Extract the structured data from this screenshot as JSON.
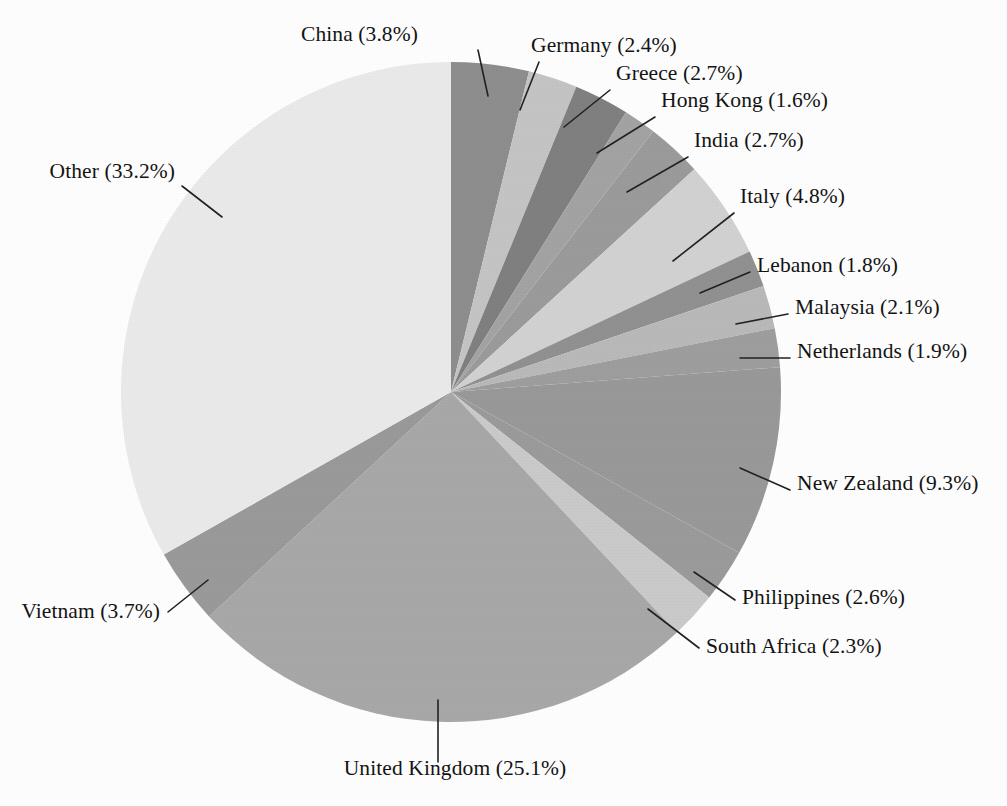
{
  "page": {
    "title_partial": "",
    "background_color": "#fefefe"
  },
  "chart_data": {
    "type": "pie",
    "title": "",
    "subtitle": "",
    "xlabel": "",
    "ylabel": "",
    "legend_position": "none",
    "grid": false,
    "label_format": "{name} ({value}%)",
    "start_angle_deg": 0,
    "direction": "clockwise",
    "center": {
      "x": 451,
      "y": 392
    },
    "radius": 330,
    "categories": [
      "China",
      "Germany",
      "Greece",
      "Hong Kong",
      "India",
      "Italy",
      "Lebanon",
      "Malaysia",
      "Netherlands",
      "New Zealand",
      "Philippines",
      "South Africa",
      "United Kingdom",
      "Vietnam",
      "Other"
    ],
    "values": [
      3.8,
      2.4,
      2.7,
      1.6,
      2.7,
      4.8,
      1.8,
      2.1,
      1.9,
      9.3,
      2.6,
      2.3,
      25.1,
      3.7,
      33.2
    ],
    "unit": "%",
    "slices": [
      {
        "name": "China",
        "value": 3.8,
        "label": "China (3.8%)",
        "color": "#8e8e8e",
        "label_x": 418,
        "label_y": 41,
        "anchor": "end",
        "leader": [
          [
            478,
            50
          ],
          [
            488,
            96
          ]
        ]
      },
      {
        "name": "Germany",
        "value": 2.4,
        "label": "Germany (2.4%)",
        "color": "#c4c4c4",
        "label_x": 531,
        "label_y": 52,
        "anchor": "start",
        "leader": [
          [
            539,
            62
          ],
          [
            520,
            110
          ]
        ]
      },
      {
        "name": "Greece",
        "value": 2.7,
        "label": "Greece (2.7%)",
        "color": "#808080",
        "label_x": 616,
        "label_y": 80,
        "anchor": "start",
        "leader": [
          [
            610,
            90
          ],
          [
            564,
            127
          ]
        ]
      },
      {
        "name": "Hong Kong",
        "value": 1.6,
        "label": "Hong Kong (1.6%)",
        "color": "#a3a3a3",
        "label_x": 661,
        "label_y": 107,
        "anchor": "start",
        "leader": [
          [
            655,
            117
          ],
          [
            597,
            153
          ]
        ]
      },
      {
        "name": "India",
        "value": 2.7,
        "label": "India (2.7%)",
        "color": "#9b9b9b",
        "label_x": 694,
        "label_y": 147,
        "anchor": "start",
        "leader": [
          [
            688,
            157
          ],
          [
            627,
            192
          ]
        ]
      },
      {
        "name": "Italy",
        "value": 4.8,
        "label": "Italy (4.8%)",
        "color": "#d2d2d2",
        "label_x": 740,
        "label_y": 203,
        "anchor": "start",
        "leader": [
          [
            734,
            213
          ],
          [
            673,
            261
          ]
        ]
      },
      {
        "name": "Lebanon",
        "value": 1.8,
        "label": "Lebanon (1.8%)",
        "color": "#919191",
        "label_x": 757,
        "label_y": 272,
        "anchor": "start",
        "leader": [
          [
            750,
            272
          ],
          [
            700,
            293
          ]
        ]
      },
      {
        "name": "Malaysia",
        "value": 2.1,
        "label": "Malaysia (2.1%)",
        "color": "#b9b9b9",
        "label_x": 795,
        "label_y": 314,
        "anchor": "start",
        "leader": [
          [
            788,
            314
          ],
          [
            736,
            324
          ]
        ]
      },
      {
        "name": "Netherlands",
        "value": 1.9,
        "label": "Netherlands (1.9%)",
        "color": "#9e9e9e",
        "label_x": 797,
        "label_y": 358,
        "anchor": "start",
        "leader": [
          [
            790,
            358
          ],
          [
            740,
            358
          ]
        ]
      },
      {
        "name": "New Zealand",
        "value": 9.3,
        "label": "New Zealand (9.3%)",
        "color": "#999999",
        "label_x": 797,
        "label_y": 490,
        "anchor": "start",
        "leader": [
          [
            790,
            490
          ],
          [
            740,
            468
          ]
        ]
      },
      {
        "name": "Philippines",
        "value": 2.6,
        "label": "Philippines (2.6%)",
        "color": "#9b9b9b",
        "label_x": 742,
        "label_y": 604,
        "anchor": "start",
        "leader": [
          [
            735,
            600
          ],
          [
            694,
            572
          ]
        ]
      },
      {
        "name": "South Africa",
        "value": 2.3,
        "label": "South Africa (2.3%)",
        "color": "#cacaca",
        "label_x": 706,
        "label_y": 653,
        "anchor": "start",
        "leader": [
          [
            699,
            648
          ],
          [
            648,
            609
          ]
        ]
      },
      {
        "name": "United Kingdom",
        "value": 25.1,
        "label": "United Kingdom (25.1%)",
        "color": "#a8a8a8",
        "label_x": 455,
        "label_y": 775,
        "anchor": "middle",
        "leader": [
          [
            438,
            762
          ],
          [
            438,
            700
          ]
        ]
      },
      {
        "name": "Vietnam",
        "value": 3.7,
        "label": "Vietnam (3.7%)",
        "color": "#9a9a9a",
        "label_x": 160,
        "label_y": 618,
        "anchor": "end",
        "leader": [
          [
            168,
            612
          ],
          [
            208,
            580
          ]
        ]
      },
      {
        "name": "Other",
        "value": 33.2,
        "label": "Other (33.2%)",
        "color": "#eaeaea",
        "label_x": 175,
        "label_y": 178,
        "anchor": "end",
        "leader": [
          [
            182,
            186
          ],
          [
            222,
            217
          ]
        ]
      }
    ]
  }
}
